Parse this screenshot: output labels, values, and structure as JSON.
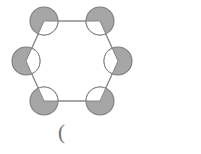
{
  "figure": {
    "shape_name": "hexagon",
    "node_count": 6,
    "edge_count": 6,
    "background_color": "#ffffff",
    "node_fill_color": "#a6a6a6",
    "node_stroke_color": "#7d7d7d",
    "wedge_fill_color": "#ffffff",
    "edge_color": "#8a8a8a",
    "edge_width": 1.4,
    "node_radius": 14,
    "center": {
      "x": 72,
      "y": 61
    },
    "ring_radius": 57,
    "nodes": [
      {
        "id": "n1",
        "label": "",
        "angle_deg": 240,
        "cx": 44,
        "cy": 21,
        "wedge_direction": "inward-down-right"
      },
      {
        "id": "n2",
        "label": "",
        "angle_deg": 300,
        "cx": 100,
        "cy": 21,
        "wedge_direction": "inward-down-left"
      },
      {
        "id": "n3",
        "label": "",
        "angle_deg": 0,
        "cx": 118,
        "cy": 61,
        "wedge_direction": "inward-left"
      },
      {
        "id": "n4",
        "label": "",
        "angle_deg": 60,
        "cx": 100,
        "cy": 101,
        "wedge_direction": "inward-up-left"
      },
      {
        "id": "n5",
        "label": "",
        "angle_deg": 120,
        "cx": 44,
        "cy": 101,
        "wedge_direction": "inward-up-right"
      },
      {
        "id": "n6",
        "label": "",
        "angle_deg": 180,
        "cx": 26,
        "cy": 61,
        "wedge_direction": "inward-right"
      }
    ],
    "edges": [
      {
        "from": "n1",
        "to": "n2"
      },
      {
        "from": "n2",
        "to": "n3"
      },
      {
        "from": "n3",
        "to": "n4"
      },
      {
        "from": "n4",
        "to": "n5"
      },
      {
        "from": "n5",
        "to": "n6"
      },
      {
        "from": "n6",
        "to": "n1"
      }
    ]
  },
  "caption": {
    "text": "(",
    "color": "#6f6f6f"
  }
}
